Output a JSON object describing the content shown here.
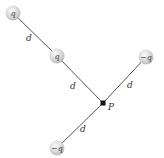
{
  "diagram": {
    "title": "",
    "point": {
      "label": "P",
      "x": 103,
      "y": 103
    },
    "charges": [
      {
        "id": "charge-top-left",
        "label": "q",
        "x": 13,
        "y": 13
      },
      {
        "id": "charge-middle",
        "label": "q",
        "x": 57,
        "y": 56
      },
      {
        "id": "charge-right",
        "label": "−q",
        "x": 146,
        "y": 57
      },
      {
        "id": "charge-bottom",
        "label": "−q",
        "x": 57,
        "y": 148
      }
    ],
    "segments": [
      {
        "from": "charge-top-left",
        "to": "charge-middle",
        "label": "d",
        "lx": 29,
        "ly": 40
      },
      {
        "from": "charge-middle",
        "to": "P",
        "label": "d",
        "lx": 73,
        "ly": 88
      },
      {
        "from": "P",
        "to": "charge-right",
        "label": "d",
        "lx": 129,
        "ly": 87
      },
      {
        "from": "P",
        "to": "charge-bottom",
        "label": "d",
        "lx": 82,
        "ly": 131
      }
    ],
    "colors": {
      "line": "#555555",
      "charge_fill": "#d8d8d8",
      "charge_highlight": "#f4f4f4",
      "point": "#111111"
    }
  }
}
